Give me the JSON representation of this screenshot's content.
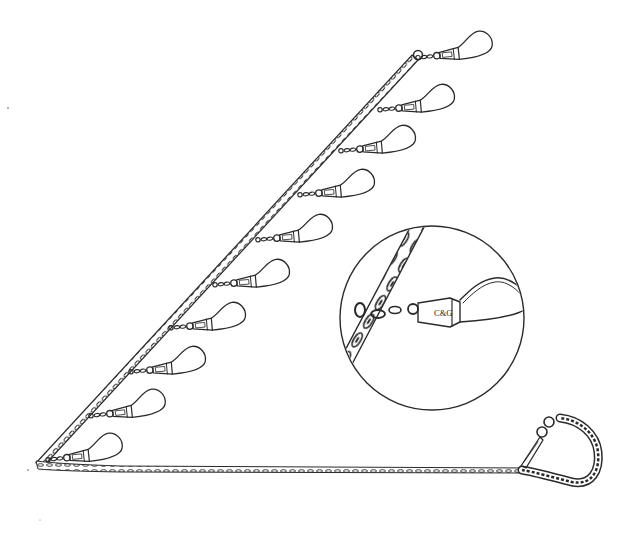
{
  "illustration": {
    "subject": "fish stringer with snap clips",
    "snap_brand_label": "C&G",
    "snap_count": 10,
    "snaps": [
      {
        "x": 415,
        "y": 58
      },
      {
        "x": 377,
        "y": 110
      },
      {
        "x": 338,
        "y": 151
      },
      {
        "x": 297,
        "y": 195
      },
      {
        "x": 255,
        "y": 240
      },
      {
        "x": 212,
        "y": 285
      },
      {
        "x": 168,
        "y": 328
      },
      {
        "x": 128,
        "y": 372
      },
      {
        "x": 88,
        "y": 416
      },
      {
        "x": 45,
        "y": 460
      }
    ],
    "detail_inset": {
      "label": "C&G",
      "cx": 432,
      "cy": 318,
      "r": 92
    },
    "colors": {
      "ink": "#2a2a2a",
      "background": "#ffffff"
    }
  }
}
